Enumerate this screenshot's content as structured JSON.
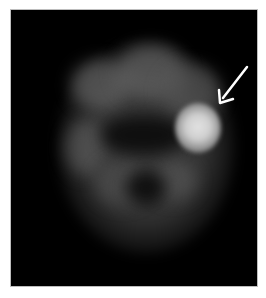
{
  "image": {
    "description": "Grayscale axial nuclear medicine brain scan with a focal hot spot",
    "background_color": "#000000",
    "hotspot_color": "#dcdcdc",
    "annotation": {
      "type": "arrow",
      "color": "#ffffff",
      "points_to": "focal bright uptake, right side of image"
    }
  }
}
